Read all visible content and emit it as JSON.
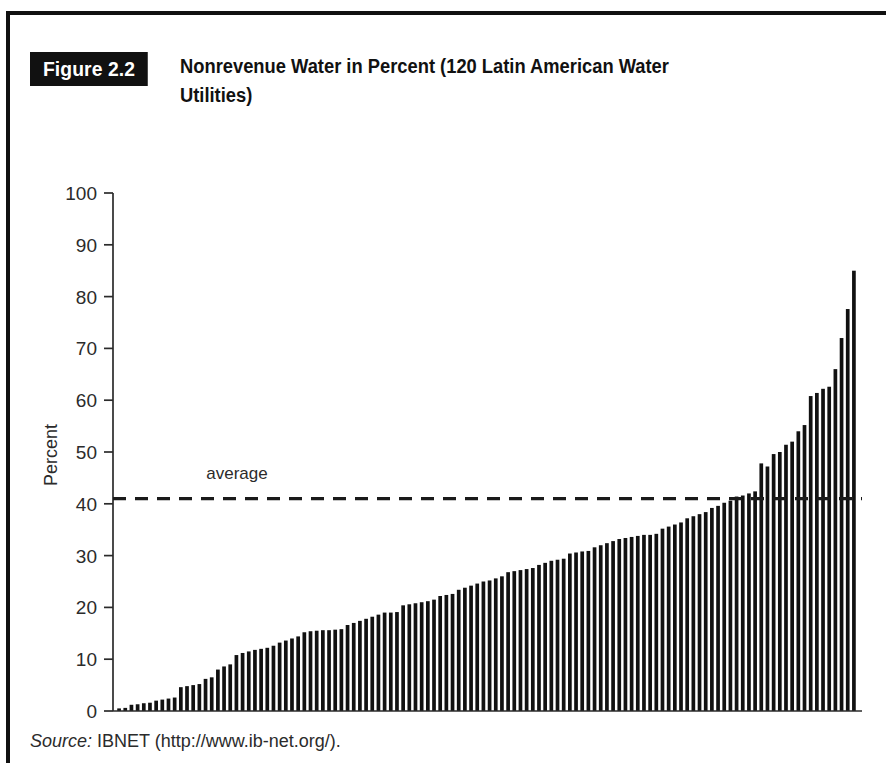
{
  "figure": {
    "tag": "Figure 2.2",
    "title": "Nonrevenue Water in Percent (120 Latin American Water Utilities)"
  },
  "source": {
    "label": "Source:",
    "text": "IBNET (http://www.ib-net.org/)."
  },
  "colors": {
    "ink": "#111111",
    "axis": "#2b2b2b",
    "bar": "#111111",
    "background": "#ffffff"
  },
  "chart_data": {
    "type": "bar",
    "title": "Nonrevenue Water in Percent (120 Latin American Water Utilities)",
    "xlabel": "",
    "ylabel": "Percent",
    "ylim": [
      0,
      100
    ],
    "yticks": [
      0,
      10,
      20,
      30,
      40,
      50,
      60,
      70,
      80,
      90,
      100
    ],
    "ytick_labels": [
      "0",
      "10",
      "20",
      "30",
      "40",
      "50",
      "60",
      "70",
      "80",
      "90",
      "100"
    ],
    "grid": false,
    "legend": "none",
    "xaxis_visible": false,
    "n_points": 120,
    "annotations": [
      {
        "name": "average",
        "label": "average",
        "type": "hline",
        "value": 41,
        "style": "dashed"
      }
    ],
    "categories": [
      "1",
      "2",
      "3",
      "4",
      "5",
      "6",
      "7",
      "8",
      "9",
      "10",
      "11",
      "12",
      "13",
      "14",
      "15",
      "16",
      "17",
      "18",
      "19",
      "20",
      "21",
      "22",
      "23",
      "24",
      "25",
      "26",
      "27",
      "28",
      "29",
      "30",
      "31",
      "32",
      "33",
      "34",
      "35",
      "36",
      "37",
      "38",
      "39",
      "40",
      "41",
      "42",
      "43",
      "44",
      "45",
      "46",
      "47",
      "48",
      "49",
      "50",
      "51",
      "52",
      "53",
      "54",
      "55",
      "56",
      "57",
      "58",
      "59",
      "60",
      "61",
      "62",
      "63",
      "64",
      "65",
      "66",
      "67",
      "68",
      "69",
      "70",
      "71",
      "72",
      "73",
      "74",
      "75",
      "76",
      "77",
      "78",
      "79",
      "80",
      "81",
      "82",
      "83",
      "84",
      "85",
      "86",
      "87",
      "88",
      "89",
      "90",
      "91",
      "92",
      "93",
      "94",
      "95",
      "96",
      "97",
      "98",
      "99",
      "100",
      "101",
      "102",
      "103",
      "104",
      "105",
      "106",
      "107",
      "108",
      "109",
      "110",
      "111",
      "112",
      "113",
      "114",
      "115",
      "116",
      "117",
      "118",
      "119",
      "120"
    ],
    "values": [
      0.5,
      0.6,
      1.2,
      1.3,
      1.5,
      1.6,
      2.0,
      2.2,
      2.4,
      2.6,
      4.6,
      4.8,
      5.0,
      5.2,
      6.2,
      6.5,
      8.0,
      8.6,
      9.0,
      10.8,
      11.2,
      11.5,
      11.8,
      12.0,
      12.2,
      12.6,
      13.2,
      13.6,
      14.0,
      14.4,
      15.2,
      15.4,
      15.5,
      15.6,
      15.6,
      15.7,
      15.8,
      16.6,
      17.0,
      17.4,
      17.8,
      18.2,
      18.6,
      19.0,
      19.0,
      19.1,
      20.4,
      20.6,
      20.8,
      21.0,
      21.2,
      21.5,
      22.2,
      22.4,
      22.6,
      23.4,
      23.8,
      24.2,
      24.6,
      25.0,
      25.2,
      25.6,
      26.0,
      26.8,
      27.0,
      27.2,
      27.4,
      27.6,
      28.2,
      28.6,
      29.0,
      29.2,
      29.4,
      30.4,
      30.6,
      30.8,
      30.9,
      31.6,
      32.0,
      32.4,
      32.8,
      33.2,
      33.4,
      33.6,
      33.8,
      34.0,
      34.0,
      34.2,
      35.2,
      35.6,
      36.0,
      36.4,
      37.2,
      37.6,
      38.0,
      38.4,
      39.2,
      39.6,
      40.2,
      40.6,
      41.4,
      41.6,
      42.0,
      42.4,
      47.8,
      47.2,
      49.6,
      50.0,
      51.4,
      52.0,
      54.0,
      55.2,
      60.8,
      61.4,
      62.2,
      62.6,
      66.0,
      72.0,
      77.6,
      85.0
    ],
    "last_two_note": {
      "bar_119": 77.6,
      "bar_120": 85.0,
      "bar_120_neighbor": 83.5
    }
  }
}
